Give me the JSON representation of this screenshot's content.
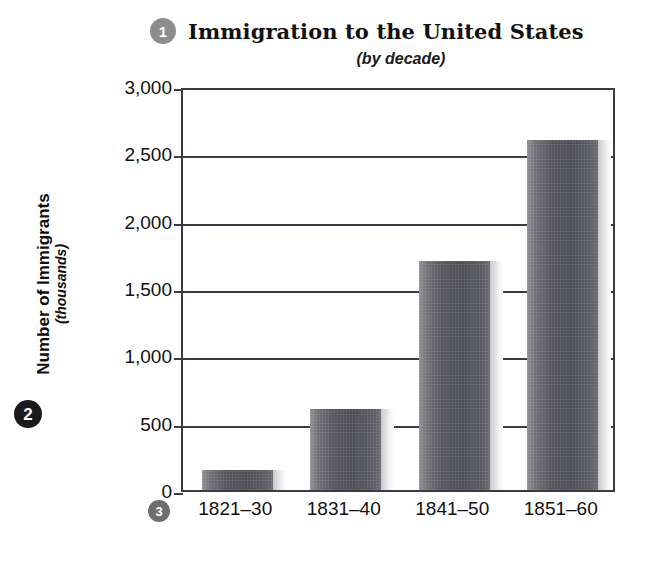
{
  "chart_data": {
    "type": "bar",
    "title": "Immigration to the United States",
    "subtitle": "(by decade)",
    "xlabel": "",
    "ylabel": "Number of Immigrants",
    "ylabel_sub": "(thousands)",
    "categories": [
      "1821–30",
      "1831–40",
      "1841–50",
      "1851–60"
    ],
    "values": [
      150,
      600,
      1700,
      2600
    ],
    "ylim": [
      0,
      3000
    ],
    "ytick_values": [
      0,
      500,
      1000,
      1500,
      2000,
      2500,
      3000
    ],
    "ytick_labels": [
      "0",
      "500",
      "1,000",
      "1,500",
      "2,000",
      "2,500",
      "3,000"
    ],
    "grid": true,
    "legend": "none",
    "bar_color": "#55555c"
  },
  "callouts": {
    "title_badge": "1",
    "yaxis_badge": "2",
    "xaxis_badge": "3"
  },
  "colors": {
    "bar": "#55555c",
    "axis": "#3b3b47",
    "badge_gray": "#8d8d8d",
    "badge_black": "#1a1a1a",
    "text": "#111111"
  }
}
